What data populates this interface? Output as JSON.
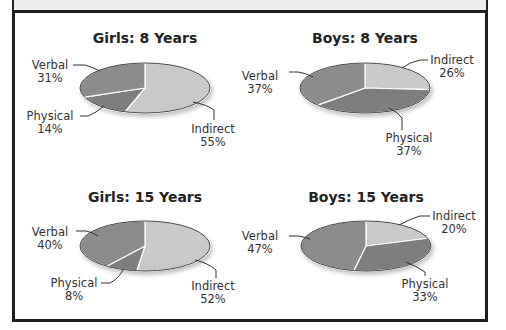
{
  "chart_data": [
    {
      "type": "pie",
      "title": "Girls: 8 Years",
      "categories": [
        "Indirect",
        "Physical",
        "Verbal"
      ],
      "values": [
        55,
        14,
        31
      ],
      "labels": [
        "Indirect 55%",
        "Physical 14%",
        "Verbal 31%"
      ]
    },
    {
      "type": "pie",
      "title": "Boys: 8 Years",
      "categories": [
        "Indirect",
        "Physical",
        "Verbal"
      ],
      "values": [
        26,
        37,
        37
      ],
      "labels": [
        "Indirect 26%",
        "Physical 37%",
        "Verbal 37%"
      ]
    },
    {
      "type": "pie",
      "title": "Girls: 15 Years",
      "categories": [
        "Indirect",
        "Physical",
        "Verbal"
      ],
      "values": [
        52,
        8,
        40
      ],
      "labels": [
        "Indirect 52%",
        "Physical 8%",
        "Verbal 40%"
      ]
    },
    {
      "type": "pie",
      "title": "Boys: 15 Years",
      "categories": [
        "Indirect",
        "Physical",
        "Verbal"
      ],
      "values": [
        20,
        33,
        47
      ],
      "labels": [
        "Indirect 20%",
        "Physical 33%",
        "Verbal 47%"
      ]
    }
  ],
  "colors": {
    "Indirect": "#c9c9c9",
    "Physical": "#7e7e7e",
    "Verbal": "#8c8c8c",
    "outline": "#444444"
  },
  "charts": [
    {
      "title": "Girls: 8 Years",
      "verbal": {
        "name": "Verbal",
        "pct": "31%"
      },
      "physical": {
        "name": "Physical",
        "pct": "14%"
      },
      "indirect": {
        "name": "Indirect",
        "pct": "55%"
      }
    },
    {
      "title": "Boys: 8 Years",
      "verbal": {
        "name": "Verbal",
        "pct": "37%"
      },
      "physical": {
        "name": "Physical",
        "pct": "37%"
      },
      "indirect": {
        "name": "Indirect",
        "pct": "26%"
      }
    },
    {
      "title": "Girls: 15 Years",
      "verbal": {
        "name": "Verbal",
        "pct": "40%"
      },
      "physical": {
        "name": "Physical",
        "pct": "8%"
      },
      "indirect": {
        "name": "Indirect",
        "pct": "52%"
      }
    },
    {
      "title": "Boys: 15 Years",
      "verbal": {
        "name": "Verbal",
        "pct": "47%"
      },
      "physical": {
        "name": "Physical",
        "pct": "33%"
      },
      "indirect": {
        "name": "Indirect",
        "pct": "20%"
      }
    }
  ]
}
